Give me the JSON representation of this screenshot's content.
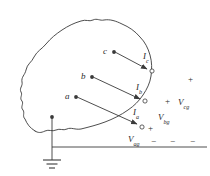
{
  "figure": {
    "type": "circuit-diagram",
    "stroke_color": "#3a3a3a",
    "text_color": "#2b2b2b",
    "background": "#ffffff"
  },
  "terminals": [
    {
      "id": "c",
      "label": "c",
      "x": 106,
      "y": 52
    },
    {
      "id": "b",
      "label": "b",
      "x": 84,
      "y": 77
    },
    {
      "id": "a",
      "label": "a",
      "x": 68,
      "y": 97
    }
  ],
  "currents": [
    {
      "id": "Ic",
      "symbol": "I",
      "subscript": "c",
      "label": "Ic",
      "x": 146,
      "y": 57
    },
    {
      "id": "Ib",
      "symbol": "I",
      "subscript": "b",
      "label": "Ib",
      "x": 139,
      "y": 88
    },
    {
      "id": "Ia",
      "symbol": "I",
      "subscript": "a",
      "label": "Ia",
      "x": 136,
      "y": 113
    }
  ],
  "voltages": [
    {
      "id": "Vcg",
      "symbol": "V",
      "subscript": "cg",
      "label": "Vcg",
      "x": 183,
      "y": 103
    },
    {
      "id": "Vbg",
      "symbol": "V",
      "subscript": "bg",
      "label": "Vbg",
      "x": 163,
      "y": 118
    },
    {
      "id": "Vag",
      "symbol": "V",
      "subscript": "ag",
      "label": "Vag",
      "x": 133,
      "y": 139
    }
  ],
  "polarity_marks": [
    {
      "id": "plus-cg-top",
      "sign": "+",
      "x": 190,
      "y": 79
    },
    {
      "id": "plus-cg",
      "sign": "+",
      "x": 167,
      "y": 101
    },
    {
      "id": "plus-bg",
      "sign": "+",
      "x": 150,
      "y": 128
    },
    {
      "id": "minus-ag",
      "sign": "−",
      "x": 153,
      "y": 141
    },
    {
      "id": "minus-bg",
      "sign": "−",
      "x": 172,
      "y": 141
    },
    {
      "id": "minus-cg",
      "sign": "−",
      "x": 192,
      "y": 141
    }
  ],
  "ground": {
    "name": "earth-ground",
    "node_x": 52,
    "node_y": 117,
    "stem_bottom_y": 160,
    "bar_widths": [
      18,
      11,
      6
    ]
  },
  "reference_line": {
    "name": "ground-reference-line",
    "x1": 22,
    "x2": 207,
    "y": 147
  }
}
